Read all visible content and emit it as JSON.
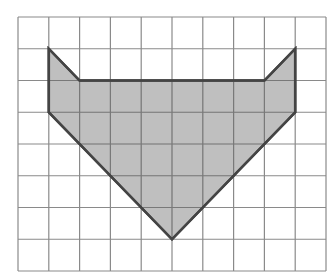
{
  "diagram": {
    "type": "grid-polygon",
    "grid": {
      "columns": 10,
      "rows": 8,
      "origin_px": [
        18,
        17
      ],
      "cell_w": 30.8,
      "cell_h": 31.75,
      "line_color": "#8a8a8a"
    },
    "shape": {
      "name": "shaded-polygon",
      "fill": "#b4b4b4",
      "stroke": "#444444",
      "vertices": [
        [
          1,
          1
        ],
        [
          2,
          2
        ],
        [
          8,
          2
        ],
        [
          9,
          1
        ],
        [
          9,
          3
        ],
        [
          5,
          7
        ],
        [
          1,
          3
        ]
      ]
    }
  }
}
